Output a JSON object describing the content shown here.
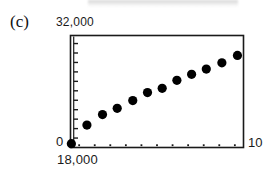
{
  "figure": {
    "panel_letter": "(c)",
    "y_axis_top_label": "32,000",
    "y_axis_zero_label": "0",
    "x_axis_left_label": "18,000",
    "x_axis_right_label": "10"
  },
  "chart_data": {
    "type": "scatter",
    "title": "(c)",
    "xlabel": "",
    "ylabel": "",
    "xlim": [
      0,
      10
    ],
    "ylim": [
      0,
      32000
    ],
    "x_tick_labels": [
      "18,000",
      "10"
    ],
    "y_tick_labels": [
      "0",
      "32,000"
    ],
    "grid": false,
    "legend": null,
    "marker": "filled-circle",
    "marker_color": "#000000",
    "n_points": 12,
    "x": [
      0.05,
      0.95,
      1.85,
      2.7,
      3.6,
      4.45,
      5.3,
      6.15,
      7.0,
      7.85,
      8.75,
      9.65
    ],
    "y": [
      1100,
      6400,
      9400,
      11200,
      13400,
      15700,
      16900,
      19200,
      20900,
      22400,
      24200,
      26300
    ],
    "points": [
      {
        "x": 0.05,
        "y": 1100
      },
      {
        "x": 0.95,
        "y": 6400
      },
      {
        "x": 1.85,
        "y": 9400
      },
      {
        "x": 2.7,
        "y": 11200
      },
      {
        "x": 3.6,
        "y": 13400
      },
      {
        "x": 4.45,
        "y": 15700
      },
      {
        "x": 5.3,
        "y": 16900
      },
      {
        "x": 6.15,
        "y": 19200
      },
      {
        "x": 7.0,
        "y": 20900
      },
      {
        "x": 7.85,
        "y": 22400
      },
      {
        "x": 8.75,
        "y": 24200
      },
      {
        "x": 9.65,
        "y": 26300
      }
    ],
    "y_minor_ticks": [
      2700,
      5400,
      8100,
      10800,
      13500,
      16200,
      18900,
      21600,
      24300,
      27000,
      29700
    ],
    "x_minor_ticks": [
      0.5,
      1.4,
      2.3,
      3.2,
      4.1,
      5.0,
      5.9,
      6.8,
      7.7,
      8.6,
      9.5
    ],
    "axis_color": "#1a1a1a"
  }
}
